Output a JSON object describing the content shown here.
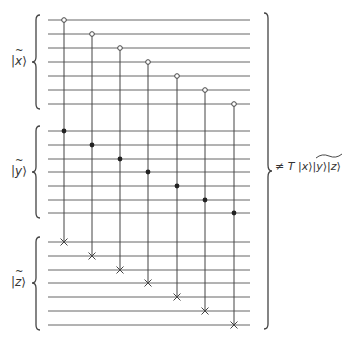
{
  "diagram": {
    "type": "quantum-circuit",
    "registers": [
      {
        "name": "x",
        "label_var": "x",
        "label": "|x̃⟩",
        "wires_y": [
          20,
          34,
          48,
          62,
          76,
          90,
          104
        ]
      },
      {
        "name": "y",
        "label_var": "y",
        "label": "|ỹ⟩",
        "wires_y": [
          131,
          145,
          159,
          172,
          186,
          200,
          213
        ]
      },
      {
        "name": "z",
        "label_var": "z",
        "label": "|z̃⟩",
        "wires_y": [
          242,
          256,
          270,
          283,
          297,
          311,
          325
        ]
      }
    ],
    "wire_x_start": 48,
    "wire_x_end": 250,
    "gates": [
      {
        "x": 64,
        "control_open_y": 20,
        "control_filled_y": 131,
        "target_y": 242
      },
      {
        "x": 92,
        "control_open_y": 34,
        "control_filled_y": 145,
        "target_y": 256
      },
      {
        "x": 120,
        "control_open_y": 48,
        "control_filled_y": 159,
        "target_y": 270
      },
      {
        "x": 148,
        "control_open_y": 62,
        "control_filled_y": 172,
        "target_y": 283
      },
      {
        "x": 177,
        "control_open_y": 76,
        "control_filled_y": 186,
        "target_y": 297
      },
      {
        "x": 205,
        "control_open_y": 90,
        "control_filled_y": 200,
        "target_y": 311
      },
      {
        "x": 234,
        "control_open_y": 104,
        "control_filled_y": 213,
        "target_y": 325
      }
    ],
    "output": {
      "prefix": "≠",
      "operator": "T",
      "kets": [
        "x",
        "y",
        "z"
      ],
      "text": "≠ T |x⟩|y⟩|z⟩"
    },
    "colors": {
      "line": "#555555",
      "text": "#333333",
      "background": "#ffffff"
    }
  }
}
